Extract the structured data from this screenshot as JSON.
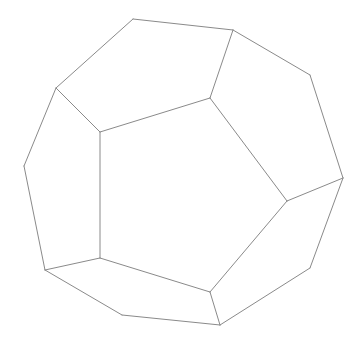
{
  "diagram": {
    "type": "dodecahedron-wireframe",
    "stroke_color": "#8a8a8a",
    "background": "#ffffff",
    "vertices": {
      "a": [
        133,
        19
      ],
      "b": [
        233,
        30
      ],
      "c": [
        310,
        75
      ],
      "d": [
        343,
        178
      ],
      "e": [
        310,
        268
      ],
      "f": [
        220,
        325
      ],
      "g": [
        122,
        315
      ],
      "h": [
        45,
        270
      ],
      "i": [
        24,
        166
      ],
      "j": [
        56,
        88
      ],
      "p1": [
        100,
        132
      ],
      "p2": [
        210,
        98
      ],
      "p3": [
        287,
        201
      ],
      "p4": [
        210,
        292
      ],
      "p5": [
        100,
        258
      ]
    },
    "edges": [
      [
        "a",
        "b"
      ],
      [
        "b",
        "c"
      ],
      [
        "c",
        "d"
      ],
      [
        "d",
        "e"
      ],
      [
        "e",
        "f"
      ],
      [
        "f",
        "g"
      ],
      [
        "g",
        "h"
      ],
      [
        "h",
        "i"
      ],
      [
        "i",
        "j"
      ],
      [
        "j",
        "a"
      ],
      [
        "p1",
        "p2"
      ],
      [
        "p2",
        "p3"
      ],
      [
        "p3",
        "p4"
      ],
      [
        "p4",
        "p5"
      ],
      [
        "p5",
        "p1"
      ],
      [
        "j",
        "p1"
      ],
      [
        "b",
        "p2"
      ],
      [
        "d",
        "p3"
      ],
      [
        "f",
        "p4"
      ],
      [
        "h",
        "p5"
      ]
    ]
  }
}
